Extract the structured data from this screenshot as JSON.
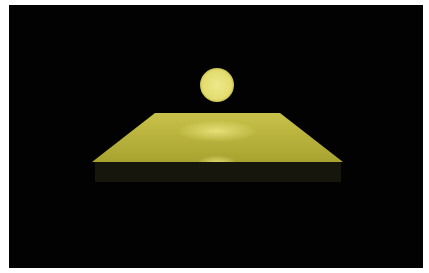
{
  "scene": {
    "description": "Rendered 3D scene: glowing yellow sphere floating above a yellow plane on black background",
    "colors": {
      "background": "#020202",
      "frame": "#ffffff",
      "sphere": "#e8e27a",
      "plane_light": "#e6e07a",
      "plane_dark": "#9a9628",
      "front_face": "#141408"
    }
  }
}
